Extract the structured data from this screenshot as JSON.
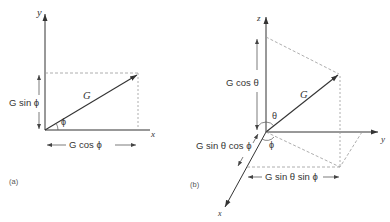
{
  "panel_a": {
    "caption": "(a)",
    "axis_y": "y",
    "axis_x": "x",
    "vector": "G",
    "angle": "ϕ",
    "vertical_component": "G sin ϕ",
    "horizontal_component": "G cos ϕ"
  },
  "panel_b": {
    "caption": "(b)",
    "axis_z": "z",
    "axis_y": "y",
    "axis_x": "x",
    "vector": "G",
    "angle_theta": "θ",
    "angle_phi": "ϕ",
    "z_component": "G cos θ",
    "x_component": "G sin θ cos ϕ",
    "y_component": "G sin θ sin ϕ"
  },
  "colors": {
    "line": "#333333",
    "dashed": "#999999",
    "background": "#ffffff"
  }
}
